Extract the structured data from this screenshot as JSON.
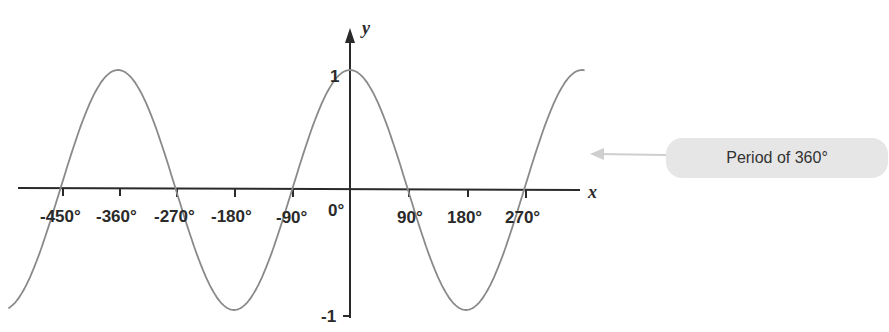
{
  "chart_data": {
    "type": "line",
    "title": "",
    "function": "y = cos(x)",
    "xlabel": "x",
    "ylabel": "y",
    "x_tick_labels": [
      "-450°",
      "-360°",
      "-270°",
      "-180°",
      "-90°",
      "0°",
      "90°",
      "180°",
      "270°"
    ],
    "x_ticks": [
      -450,
      -360,
      -270,
      -180,
      -90,
      0,
      90,
      180,
      270
    ],
    "y_tick_labels": [
      "1",
      "-1"
    ],
    "y_ticks": [
      1,
      -1
    ],
    "xlim": [
      -530,
      365
    ],
    "ylim": [
      -1,
      1
    ],
    "grid": false,
    "series": [
      {
        "name": "cos(x)",
        "color": "#8a8a8a",
        "x": [
          -450,
          -360,
          -270,
          -180,
          -90,
          0,
          90,
          180,
          270,
          360
        ],
        "y": [
          0,
          1,
          0,
          -1,
          0,
          1,
          0,
          -1,
          0,
          1
        ]
      }
    ],
    "annotations": [
      {
        "text": "Period of 360°",
        "type": "callout-arrow"
      }
    ]
  },
  "labels": {
    "x_axis": "x",
    "y_axis": "y",
    "y_max": "1",
    "y_min": "-1",
    "ticks": {
      "m450": "-450°",
      "m360": "-360°",
      "m270": "-270°",
      "m180": "-180°",
      "m90": "-90°",
      "zero": "0°",
      "p90": "90°",
      "p180": "180°",
      "p270": "270°"
    },
    "callout": "Period of 360°"
  }
}
